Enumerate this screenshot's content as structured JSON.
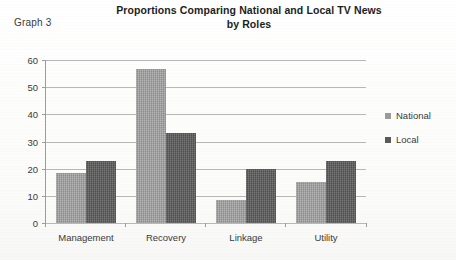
{
  "figure_label": "Graph 3",
  "chart_data": {
    "type": "bar",
    "title": "Proportions Comparing National and  Local TV News by Roles",
    "title_line1": "Proportions Comparing National and  Local TV News",
    "title_line2": "by Roles",
    "xlabel": "",
    "ylabel": "",
    "ylim": [
      0,
      60
    ],
    "ytick_labels": [
      "0",
      "10",
      "20",
      "30",
      "40",
      "50",
      "60"
    ],
    "ytick_values": [
      0,
      10,
      20,
      30,
      40,
      50,
      60
    ],
    "grid": true,
    "legend_position": "right",
    "categories": [
      "Management",
      "Recovery",
      "Linkage",
      "Utility"
    ],
    "series": [
      {
        "name": "National",
        "color": "#9b9b9b",
        "values": [
          18.5,
          56.7,
          8.5,
          15.1
        ]
      },
      {
        "name": "Local",
        "color": "#5a5a5a",
        "values": [
          23.0,
          33.1,
          20.0,
          23.0
        ]
      }
    ]
  }
}
